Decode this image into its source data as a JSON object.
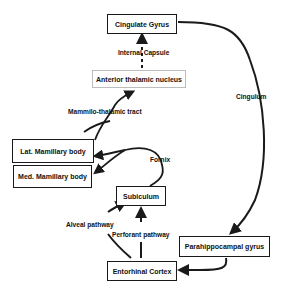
{
  "diagram": {
    "nodes": {
      "cingulate_gyrus": "Cingulate Gyrus",
      "anterior_thalamic": "Anterior thalamic nucleus",
      "lat_mamillary": "Lat. Mamillary body",
      "med_mamillary": "Med. Mamillary body",
      "subiculum": "Subiculum",
      "parahippocampal": "Parahippocampal gyrus",
      "entorhinal": "Entorhinal Cortex"
    },
    "edges": {
      "internal_capsule": "Internal Capsule",
      "mammilo_thalamic": "Mammilo-thalamic tract",
      "fornix": "Fornix",
      "cingulum": "Cingulum",
      "alveal": "Alveal pathway",
      "perforant": "Perforant pathway"
    },
    "colors": {
      "stroke": "#1a1a1a",
      "thin_border": "#bdbdbd"
    }
  }
}
